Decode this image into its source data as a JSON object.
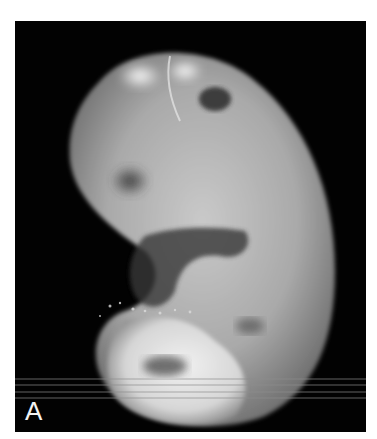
{
  "figure": {
    "panel_label": "A",
    "background_color": "#020202"
  }
}
